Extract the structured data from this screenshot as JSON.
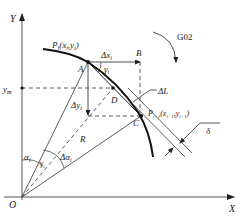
{
  "diagram": {
    "type": "circular-interpolation-geometry",
    "axes": {
      "x_label": "X",
      "y_label": "Y",
      "origin_label": "O"
    },
    "points": {
      "A": "A",
      "B": "B",
      "C": "C",
      "D": "D"
    },
    "labels": {
      "p_i_prefix": "P",
      "p_i_sub": "i",
      "p_i_coords": "(x",
      "p_i_coords_sub1": "i",
      "p_i_coords_mid": ",y",
      "p_i_coords_sub2": "i",
      "p_i_coords_end": ")",
      "p_next_prefix": "P",
      "p_next_sub": "i+1",
      "p_next_open": "(x",
      "p_next_sub1": "i+1",
      "p_next_mid": ",y",
      "p_next_sub2": "i+1",
      "p_next_end": ")",
      "delta_x": "Δx",
      "delta_x_sub": "i",
      "delta_y": "Δy",
      "delta_y_sub": "i",
      "gamma": "γ",
      "gamma_sub": "i",
      "y_m": "y",
      "y_m_sub": "m",
      "delta_L": "ΔL",
      "delta": "δ",
      "radius": "R",
      "alpha": "α",
      "alpha_sub": "i",
      "delta_alpha": "Δα",
      "delta_alpha_sub": "i",
      "gamma_small": "γ",
      "gamma_small_sub": "i",
      "direction": "G02"
    },
    "colors": {
      "line": "#222222",
      "axis": "#555555",
      "background": "#ffffff"
    }
  }
}
